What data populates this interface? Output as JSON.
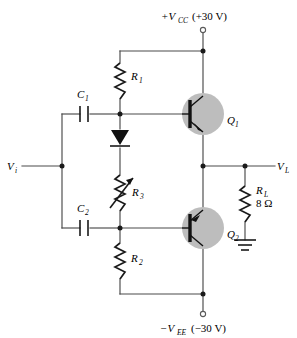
{
  "figure": {
    "type": "schematic"
  },
  "supplies": {
    "positive": {
      "symbol": "+V",
      "subscript": "CC",
      "value": "(+30 V)",
      "terminal": "open-circle"
    },
    "negative": {
      "symbol": "−V",
      "subscript": "EE",
      "value": "(−30 V)",
      "terminal": "open-circle"
    }
  },
  "ports": {
    "input": {
      "symbol": "V",
      "subscript": "i"
    },
    "output": {
      "symbol": "V",
      "subscript": "L"
    }
  },
  "components": {
    "c1": {
      "symbol": "C",
      "subscript": "1",
      "type": "capacitor"
    },
    "c2": {
      "symbol": "C",
      "subscript": "2",
      "type": "capacitor"
    },
    "r1": {
      "symbol": "R",
      "subscript": "1",
      "type": "resistor"
    },
    "r2": {
      "symbol": "R",
      "subscript": "2",
      "type": "resistor"
    },
    "r3": {
      "symbol": "R",
      "subscript": "3",
      "type": "variable-resistor"
    },
    "rl": {
      "symbol": "R",
      "subscript": "L",
      "value": "8 Ω",
      "type": "resistor"
    },
    "q1": {
      "symbol": "Q",
      "subscript": "1",
      "type": "npn-transistor"
    },
    "q2": {
      "symbol": "Q",
      "subscript": "2",
      "type": "pnp-transistor"
    },
    "d1": {
      "type": "diode"
    },
    "ground": {
      "type": "earth-ground"
    }
  },
  "colors": {
    "wire": "#4a4a4a",
    "component": "#1a1a1a",
    "transistor_body": "#bdbdbd",
    "background": "#ffffff"
  }
}
